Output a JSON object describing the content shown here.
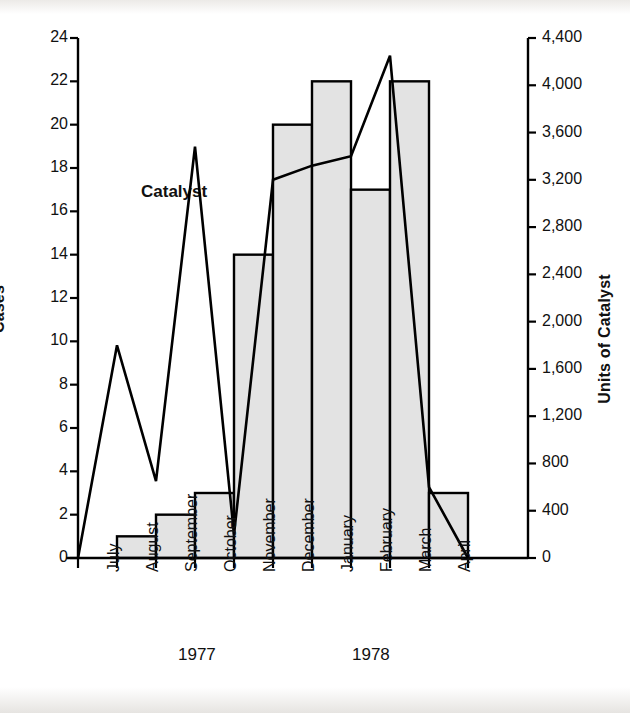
{
  "figure": {
    "series_label": "Catalyst",
    "left_axis_title": "Cases",
    "right_axis_title": "Units of Catalyst",
    "year_groups": [
      {
        "label": "1977"
      },
      {
        "label": "1978"
      }
    ]
  },
  "chart_data": {
    "type": "bar",
    "title": "",
    "xlabel": "",
    "ylabel": "Cases",
    "y2label": "Units of Catalyst",
    "categories": [
      "July",
      "August",
      "September",
      "October",
      "November",
      "December",
      "January",
      "February",
      "March",
      "April"
    ],
    "ylim": [
      0,
      24
    ],
    "y2lim": [
      0,
      4400
    ],
    "grid": false,
    "legend": "inline-annotation",
    "left_ticks": [
      "0",
      "2",
      "4",
      "6",
      "8",
      "10",
      "12",
      "14",
      "16",
      "18",
      "20",
      "22",
      "24"
    ],
    "left_tick_values": [
      0,
      2,
      4,
      6,
      8,
      10,
      12,
      14,
      16,
      18,
      20,
      22,
      24
    ],
    "right_ticks": [
      "0",
      "400",
      "800",
      "1,200",
      "1,600",
      "2,000",
      "2,400",
      "2,800",
      "3,200",
      "3,600",
      "4,000",
      "4,400"
    ],
    "right_tick_values": [
      0,
      400,
      800,
      1200,
      1600,
      2000,
      2400,
      2800,
      3200,
      3600,
      4000,
      4400
    ],
    "series": [
      {
        "name": "Cases",
        "type": "bar",
        "axis": "left",
        "color": "#e3e3e3",
        "edge_color": "#000000",
        "values": [
          0,
          1,
          2,
          3,
          14,
          20,
          22,
          17,
          22,
          3
        ]
      },
      {
        "name": "Catalyst",
        "type": "line",
        "axis": "right",
        "color": "#000000",
        "values": [
          0,
          1800,
          650,
          3480,
          200,
          3200,
          3320,
          3400,
          4250,
          600
        ],
        "trailing_value": 0
      }
    ]
  },
  "colors": {
    "page_background": "#ffffff",
    "bar_fill": "#e3e3e3",
    "ink": "#000000"
  }
}
